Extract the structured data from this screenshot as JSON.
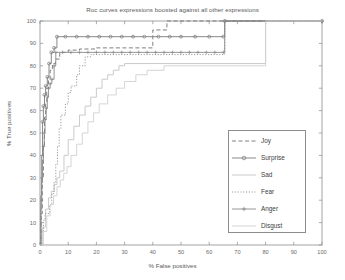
{
  "chart_data": {
    "type": "line",
    "title": "Roc curves expressions boosted against all other expressions",
    "xlabel": "% False positives",
    "ylabel": "% True positives",
    "xlim": [
      0,
      100
    ],
    "ylim": [
      0,
      100
    ],
    "xticks": [
      0,
      10,
      20,
      30,
      40,
      50,
      60,
      70,
      80,
      90,
      100
    ],
    "yticks": [
      0,
      10,
      20,
      30,
      40,
      50,
      60,
      70,
      80,
      90,
      100
    ],
    "grid": false,
    "legend_position": "right-center",
    "series": [
      {
        "name": "Joy",
        "style": "dashed",
        "color": "#707070",
        "marker": "none",
        "points": [
          [
            0,
            0
          ],
          [
            0.4,
            14
          ],
          [
            0.8,
            30
          ],
          [
            1.2,
            44
          ],
          [
            1.6,
            57
          ],
          [
            2.0,
            64
          ],
          [
            2.4,
            70
          ],
          [
            3.0,
            74
          ],
          [
            3.6,
            78
          ],
          [
            4.4,
            81
          ],
          [
            5.5,
            83
          ],
          [
            7.0,
            86
          ],
          [
            10,
            87
          ],
          [
            14,
            87.5
          ],
          [
            20,
            88
          ],
          [
            30,
            88
          ],
          [
            38,
            88
          ],
          [
            40,
            96
          ],
          [
            45,
            100
          ],
          [
            100,
            100
          ]
        ]
      },
      {
        "name": "Surprise",
        "style": "solid",
        "color": "#7a7a7a",
        "marker": "circle",
        "points": [
          [
            0,
            0
          ],
          [
            0.3,
            22
          ],
          [
            0.6,
            40
          ],
          [
            0.9,
            55
          ],
          [
            1.2,
            62
          ],
          [
            1.6,
            67
          ],
          [
            2.0,
            71
          ],
          [
            2.6,
            75
          ],
          [
            3.2,
            81
          ],
          [
            4.0,
            86
          ],
          [
            5.0,
            88
          ],
          [
            6.0,
            93
          ],
          [
            9,
            93
          ],
          [
            13,
            93
          ],
          [
            17,
            93
          ],
          [
            21,
            93
          ],
          [
            25,
            93
          ],
          [
            29,
            93
          ],
          [
            33,
            93
          ],
          [
            37,
            93
          ],
          [
            42,
            93
          ],
          [
            46,
            93
          ],
          [
            50,
            93
          ],
          [
            55,
            93
          ],
          [
            60,
            93
          ],
          [
            65,
            93
          ],
          [
            65.5,
            100
          ],
          [
            100,
            100
          ]
        ]
      },
      {
        "name": "Sad",
        "style": "solid",
        "color": "#c4c4c4",
        "marker": "none",
        "points": [
          [
            0,
            0
          ],
          [
            1.0,
            8
          ],
          [
            2.0,
            16
          ],
          [
            3.0,
            21
          ],
          [
            4.0,
            24
          ],
          [
            5.0,
            27
          ],
          [
            6.0,
            30
          ],
          [
            7.0,
            33
          ],
          [
            8.5,
            40
          ],
          [
            10,
            47
          ],
          [
            12,
            53
          ],
          [
            14,
            58
          ],
          [
            16,
            62
          ],
          [
            18,
            66
          ],
          [
            20,
            70
          ],
          [
            22,
            74
          ],
          [
            24,
            76
          ],
          [
            26,
            78
          ],
          [
            28,
            80
          ],
          [
            30,
            81
          ],
          [
            40,
            81
          ],
          [
            55,
            81
          ],
          [
            70,
            81
          ],
          [
            79,
            81
          ],
          [
            80,
            100
          ],
          [
            100,
            100
          ]
        ]
      },
      {
        "name": "Fear",
        "style": "dotted",
        "color": "#8f8f8f",
        "marker": "none",
        "points": [
          [
            0,
            0
          ],
          [
            0.6,
            6
          ],
          [
            1.2,
            11
          ],
          [
            1.8,
            14
          ],
          [
            2.6,
            14
          ],
          [
            3.4,
            18
          ],
          [
            4.2,
            23
          ],
          [
            5.0,
            28
          ],
          [
            5.6,
            36
          ],
          [
            6.2,
            44
          ],
          [
            6.8,
            52
          ],
          [
            7.4,
            58
          ],
          [
            8.2,
            58
          ],
          [
            9.0,
            63
          ],
          [
            10,
            68
          ],
          [
            11,
            71
          ],
          [
            12,
            71
          ],
          [
            13,
            76
          ],
          [
            14,
            80
          ],
          [
            16,
            84
          ],
          [
            18,
            85
          ],
          [
            22,
            85
          ],
          [
            28,
            85
          ],
          [
            34,
            85
          ],
          [
            40,
            85
          ],
          [
            48,
            85
          ],
          [
            56,
            85
          ],
          [
            62,
            85
          ],
          [
            65,
            85
          ],
          [
            65.5,
            100
          ],
          [
            100,
            100
          ]
        ]
      },
      {
        "name": "Anger",
        "style": "solid",
        "color": "#8a8a8a",
        "marker": "plus",
        "points": [
          [
            0,
            0
          ],
          [
            0.3,
            16
          ],
          [
            0.6,
            28
          ],
          [
            0.9,
            38
          ],
          [
            1.2,
            44
          ],
          [
            1.5,
            50
          ],
          [
            1.8,
            56
          ],
          [
            2.2,
            61
          ],
          [
            2.6,
            66
          ],
          [
            3.0,
            70
          ],
          [
            3.6,
            72
          ],
          [
            4.2,
            74
          ],
          [
            5.0,
            80
          ],
          [
            5.6,
            86
          ],
          [
            8,
            86
          ],
          [
            11,
            86
          ],
          [
            14,
            86
          ],
          [
            17,
            86
          ],
          [
            20,
            86
          ],
          [
            23,
            86
          ],
          [
            26,
            86
          ],
          [
            29,
            86
          ],
          [
            32,
            86
          ],
          [
            35,
            86
          ],
          [
            38,
            86
          ],
          [
            41,
            86
          ],
          [
            44,
            86
          ],
          [
            47,
            86
          ],
          [
            50,
            86
          ],
          [
            53,
            86
          ],
          [
            56,
            86
          ],
          [
            59,
            86
          ],
          [
            62,
            86
          ],
          [
            65,
            86
          ],
          [
            65.5,
            100
          ],
          [
            100,
            100
          ]
        ]
      },
      {
        "name": "Disgust",
        "style": "solid",
        "color": "#d0d0d0",
        "marker": "none",
        "points": [
          [
            0,
            0
          ],
          [
            1.2,
            6
          ],
          [
            2.4,
            13
          ],
          [
            3.6,
            18
          ],
          [
            4.8,
            22
          ],
          [
            6.0,
            26
          ],
          [
            7.2,
            29
          ],
          [
            8.4,
            32
          ],
          [
            9.6,
            35
          ],
          [
            11,
            40
          ],
          [
            13,
            45
          ],
          [
            15,
            50
          ],
          [
            17,
            55
          ],
          [
            19,
            59
          ],
          [
            21,
            63
          ],
          [
            24,
            67
          ],
          [
            27,
            70
          ],
          [
            30,
            73
          ],
          [
            34,
            76
          ],
          [
            38,
            78
          ],
          [
            44,
            80
          ],
          [
            50,
            80
          ],
          [
            60,
            80
          ],
          [
            70,
            80
          ],
          [
            79,
            80
          ],
          [
            80,
            100
          ],
          [
            100,
            100
          ]
        ]
      }
    ]
  },
  "legend": {
    "items": [
      {
        "label": "Joy"
      },
      {
        "label": "Surprise"
      },
      {
        "label": "Sad"
      },
      {
        "label": "Fear"
      },
      {
        "label": "Anger"
      },
      {
        "label": "Disgust"
      }
    ]
  }
}
